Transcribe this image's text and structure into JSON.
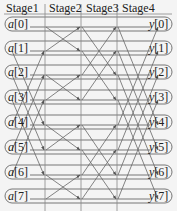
{
  "diagram": {
    "type": "butterfly-network",
    "stages": [
      "Stage1",
      "Stage2",
      "Stage3",
      "Stage4"
    ],
    "inputs": [
      "a[0]",
      "a[1]",
      "a[2]",
      "a[3]",
      "a[4]",
      "a[5]",
      "a[6]",
      "a[7]"
    ],
    "outputs": [
      "y[0]",
      "y[1]",
      "y[2]",
      "y[3]",
      "y[4]",
      "y[5]",
      "y[6]",
      "y[7]"
    ],
    "colors": {
      "line": "#666666",
      "text": "#222222",
      "background": "#f4f4f4"
    }
  }
}
